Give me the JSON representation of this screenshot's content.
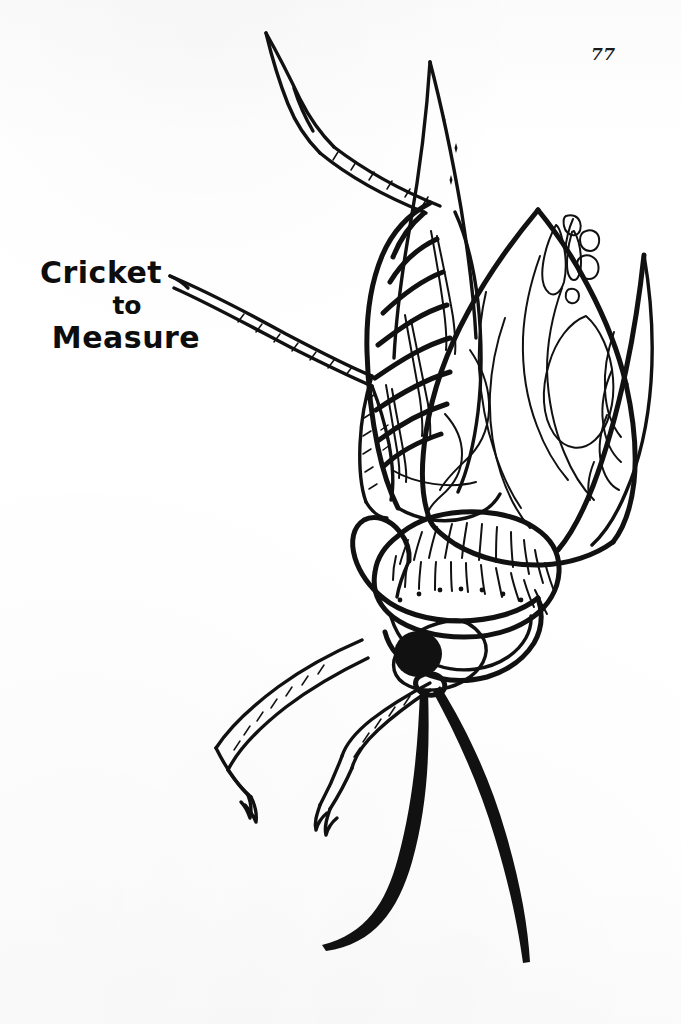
{
  "page": {
    "number": "77",
    "background_color": "#fdfdfd",
    "ink_color": "#111111",
    "width": 681,
    "height": 1024
  },
  "caption": {
    "line_1": "Cricket",
    "line_2": "to",
    "line_3": "Measure",
    "full_text": "Cricket to Measure"
  },
  "illustration": {
    "subject": "cricket",
    "style": "black-ink line drawing, hand-drawn",
    "orientation": "head pointing down-left, abdomen up",
    "parts": [
      {
        "name": "ovipositor",
        "label": "ovipositor"
      },
      {
        "name": "cercus-upper",
        "label": "upper cercus"
      },
      {
        "name": "cercus-left",
        "label": "left cercus"
      },
      {
        "name": "abdomen",
        "label": "segmented abdomen",
        "segment_count": 8
      },
      {
        "name": "forewing",
        "label": "forewing with wavy veins"
      },
      {
        "name": "hindwing",
        "label": "hindwing"
      },
      {
        "name": "stridulatory-file",
        "label": "stridulatory file cells"
      },
      {
        "name": "pronotum",
        "label": "pronotum with hatch shading"
      },
      {
        "name": "head",
        "label": "head"
      },
      {
        "name": "eye",
        "label": "compound eye"
      },
      {
        "name": "hind-leg",
        "label": "hind leg femur"
      },
      {
        "name": "middle-leg",
        "label": "middle leg"
      },
      {
        "name": "front-leg",
        "label": "front leg"
      },
      {
        "name": "antenna-left",
        "label": "left antenna"
      },
      {
        "name": "antenna-right",
        "label": "right antenna"
      }
    ]
  }
}
